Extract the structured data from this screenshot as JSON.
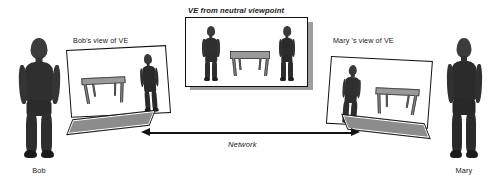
{
  "figure": {
    "title_center": "VE from neutral viewpoint",
    "label_left_screen": "Bob's view of VE",
    "label_right_screen": "Mary 's view of VE",
    "label_network": "Network",
    "name_left": "Bob",
    "name_right": "Mary",
    "colors": {
      "background": "#ffffff",
      "outline": "#111111",
      "figure_dark": "#2e2e2e",
      "figure_mid": "#4a4a4a",
      "table_gray": "#9a9a9a",
      "slab_gray": "#8c8c8c",
      "arrow": "#141414",
      "shadow": "#9e9e9e",
      "text": "#1a1a1a"
    },
    "icons": {
      "person_left": "person-silhouette-icon",
      "person_right": "person-silhouette-icon",
      "table": "table-icon",
      "display_screen": "display-screen-icon",
      "keyboard_slab": "keyboard-slab-icon",
      "network_arrow": "bidirectional-arrow-icon"
    },
    "center_panel": {
      "contents": [
        "avatar-bob",
        "virtual-table",
        "avatar-mary"
      ]
    },
    "left_screen": {
      "contents": [
        "virtual-table",
        "avatar-mary"
      ]
    },
    "right_screen": {
      "contents": [
        "avatar-bob",
        "virtual-table"
      ]
    }
  }
}
